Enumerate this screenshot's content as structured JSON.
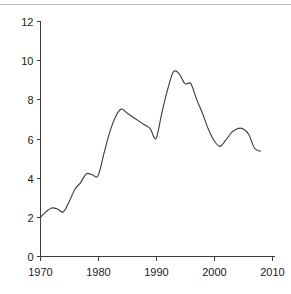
{
  "chart_data": {
    "type": "line",
    "title": "",
    "subtitle": "",
    "xlabel": "",
    "ylabel": "",
    "xlim": [
      1968,
      2012
    ],
    "ylim": [
      0,
      12
    ],
    "grid": false,
    "legend": null,
    "xticks": [
      1970,
      1980,
      1990,
      2000,
      2010
    ],
    "xtick_labels": [
      "1970",
      "1980",
      "1990",
      "2000",
      "2010"
    ],
    "yticks": [
      0,
      2,
      4,
      6,
      8,
      10,
      12
    ],
    "ytick_labels": [
      "0",
      "2",
      "4",
      "6",
      "8",
      "10",
      "12"
    ],
    "series": [
      {
        "name": "series-1",
        "color": "#3a3a3a",
        "x": [
          1970,
          1971,
          1972,
          1973,
          1974,
          1975,
          1976,
          1977,
          1978,
          1979,
          1980,
          1981,
          1982,
          1983,
          1984,
          1985,
          1986,
          1987,
          1988,
          1989,
          1990,
          1991,
          1992,
          1993,
          1994,
          1995,
          1996,
          1997,
          1998,
          1999,
          2000,
          2001,
          2002,
          2003,
          2004,
          2005,
          2006,
          2007,
          2008
        ],
        "values": [
          1.95,
          2.25,
          2.45,
          2.4,
          2.25,
          2.75,
          3.4,
          3.75,
          4.2,
          4.15,
          4.1,
          5.2,
          6.3,
          7.1,
          7.5,
          7.3,
          7.1,
          6.9,
          6.7,
          6.5,
          6.0,
          7.3,
          8.5,
          9.4,
          9.3,
          8.8,
          8.8,
          8.0,
          7.3,
          6.5,
          5.9,
          5.6,
          5.9,
          6.3,
          6.5,
          6.5,
          6.2,
          5.5,
          5.35
        ]
      }
    ]
  },
  "axes": {
    "y_axis_name": "y-axis",
    "x_axis_name": "x-axis"
  }
}
